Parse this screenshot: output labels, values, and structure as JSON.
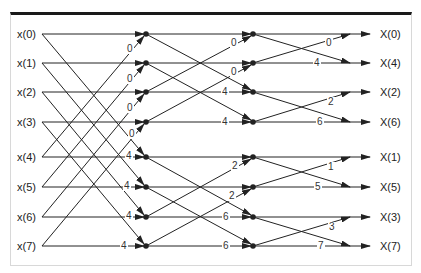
{
  "diagram": {
    "inputs": [
      "x(0)",
      "x(1)",
      "x(2)",
      "x(3)",
      "x(4)",
      "x(5)",
      "x(6)",
      "x(7)"
    ],
    "outputs": [
      "X(0)",
      "X(4)",
      "X(2)",
      "X(6)",
      "X(1)",
      "X(5)",
      "X(3)",
      "X(7)"
    ],
    "stage1_twiddles": [
      "0",
      "0",
      "0",
      "0",
      "4",
      "4",
      "4",
      "4"
    ],
    "stage2_twiddles": [
      "0",
      "0",
      "4",
      "4",
      "2",
      "2",
      "6",
      "6"
    ],
    "stage3_twiddles": [
      "0",
      "4",
      "2",
      "6",
      "1",
      "5",
      "3",
      "7"
    ],
    "colors": {
      "line": "#222222",
      "frame_top": "#1a1a1a",
      "frame_border": "#d8d8d8",
      "background": "#ffffff"
    }
  }
}
